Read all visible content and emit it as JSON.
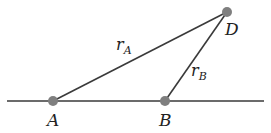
{
  "diagram": {
    "colors": {
      "line": "#3a3a3a",
      "point": "#7f7f7f",
      "text": "#222222",
      "background": "#ffffff"
    },
    "baseline": {
      "x1": 7,
      "y1": 101,
      "x2": 264,
      "y2": 101
    },
    "points": [
      {
        "id": "A",
        "label": "A",
        "x": 53,
        "y": 101
      },
      {
        "id": "B",
        "label": "B",
        "x": 165,
        "y": 101
      },
      {
        "id": "D",
        "label": "D",
        "x": 227,
        "y": 12
      }
    ],
    "segments": [
      {
        "from": "A",
        "to": "D",
        "label": "r",
        "subscript": "A"
      },
      {
        "from": "B",
        "to": "D",
        "label": "r",
        "subscript": "B"
      }
    ],
    "labels": {
      "A": "A",
      "B": "B",
      "D": "D",
      "rA_main": "r",
      "rA_sub": "A",
      "rB_main": "r",
      "rB_sub": "B"
    }
  }
}
